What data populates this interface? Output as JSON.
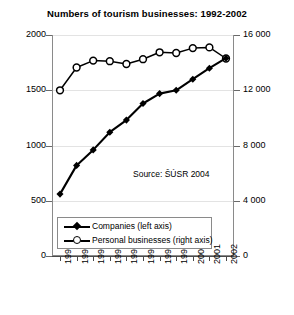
{
  "chart_data": {
    "type": "line",
    "title": "Numbers of tourism businesses: 1992-2002",
    "xlabel": "",
    "ylabel": "",
    "grid": true,
    "legend_position": "inside-bottom-left",
    "categories": [
      "1992",
      "1993",
      "1994",
      "1995",
      "1996",
      "1997",
      "1998",
      "1999",
      "2000",
      "2001",
      "2002"
    ],
    "axes": {
      "left": {
        "label": "",
        "ticks": [
          "0",
          "500",
          "1000",
          "1500",
          "2000"
        ],
        "tick_values": [
          0,
          500,
          1000,
          1500,
          2000
        ],
        "ylim": [
          0,
          2000
        ]
      },
      "right": {
        "label": "",
        "ticks": [
          "0",
          "4 000",
          "8 000",
          "12 000",
          "16 000"
        ],
        "tick_values": [
          0,
          4000,
          8000,
          12000,
          16000
        ],
        "ylim": [
          0,
          16000
        ]
      }
    },
    "series": [
      {
        "name": "Companies (left axis)",
        "axis": "left",
        "marker": "filled-diamond",
        "color": "#000000",
        "values": [
          560,
          820,
          960,
          1120,
          1230,
          1380,
          1470,
          1500,
          1600,
          1700,
          1790
        ]
      },
      {
        "name": "Personal businesses (right axis)",
        "axis": "right",
        "marker": "open-circle",
        "color": "#000000",
        "values": [
          12000,
          13650,
          14150,
          14100,
          13900,
          14250,
          14750,
          14700,
          15050,
          15100,
          14300
        ]
      }
    ],
    "annotations": [
      {
        "text": "Source: ŠÚSR 2004",
        "x": 1997,
        "y": 760
      }
    ]
  },
  "legend": {
    "items": [
      {
        "label": "Companies (left axis)",
        "marker": "filled-diamond"
      },
      {
        "label": "Personal businesses (right axis)",
        "marker": "open-circle"
      }
    ]
  },
  "source": {
    "text": "Source: ŠÚSR 2004"
  }
}
